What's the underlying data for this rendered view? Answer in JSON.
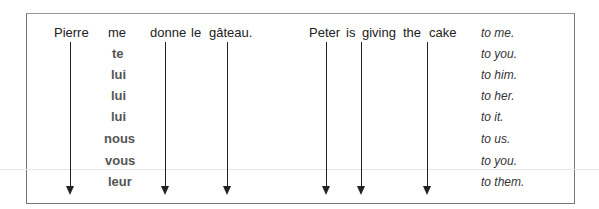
{
  "french": {
    "words": [
      {
        "text": "Pierre",
        "x": 54,
        "y": 25
      },
      {
        "text": "me",
        "x": 108,
        "y": 25
      },
      {
        "text": "donne",
        "x": 150,
        "y": 25
      },
      {
        "text": "le",
        "x": 191,
        "y": 25
      },
      {
        "text": "gâteau.",
        "x": 209,
        "y": 25
      }
    ],
    "pronouns": [
      "me",
      "te",
      "lui",
      "lui",
      "lui",
      "nous",
      "vous",
      "leur"
    ]
  },
  "english": {
    "words": [
      {
        "text": "Peter",
        "x": 309,
        "y": 25
      },
      {
        "text": "is",
        "x": 345,
        "y": 25
      },
      {
        "text": "giving",
        "x": 362,
        "y": 25
      },
      {
        "text": "the",
        "x": 393,
        "y": 25
      },
      {
        "text": "cake",
        "x": 428,
        "y": 25
      }
    ],
    "phrases": [
      "to me.",
      "to you.",
      "to him.",
      "to her.",
      "to it.",
      "to us.",
      "to you.",
      "to them."
    ]
  },
  "arrows_x": [
    70,
    166,
    227,
    327,
    362,
    428
  ],
  "row_y": [
    25,
    46,
    67,
    88,
    109,
    131,
    153,
    174
  ]
}
